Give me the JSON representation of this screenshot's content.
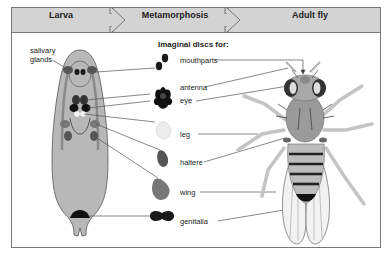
{
  "header": {
    "stages": [
      {
        "label": "Larva"
      },
      {
        "label": "Metamorphosis"
      },
      {
        "label": "Adult fly"
      }
    ],
    "fill_color": "#d3d3d3"
  },
  "larva": {
    "label": "salivary glands",
    "label_lines": [
      "salivary",
      "glands"
    ],
    "body_color": "#b8b8b8"
  },
  "discs": {
    "title": "Imaginal discs for:",
    "items": [
      {
        "label": "mouthparts",
        "color": "#1a1a1a"
      },
      {
        "label": "antenna",
        "color": "#111111"
      },
      {
        "label": "eye",
        "color": "#111111"
      },
      {
        "label": "leg",
        "color": "#e8e8e8"
      },
      {
        "label": "haltere",
        "color": "#555555"
      },
      {
        "label": "wing",
        "color": "#7a7a7a"
      },
      {
        "label": "genitalia",
        "color": "#1a1a1a"
      }
    ]
  }
}
